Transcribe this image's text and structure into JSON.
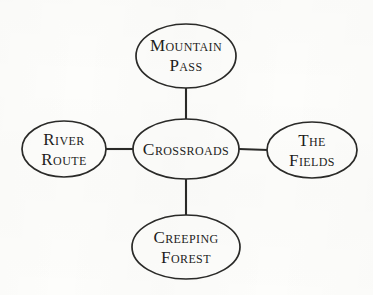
{
  "diagram": {
    "type": "hub-and-spoke-node-graph",
    "background_color": "#fdfdfb",
    "stroke_color": "#2a2a28",
    "text_color": "#1d1d1b",
    "center": {
      "id": "crossroads",
      "label": "Crossroads",
      "lines": [
        "Crossroads"
      ],
      "cx": 186,
      "cy": 149,
      "rx": 53,
      "ry": 30
    },
    "branches": [
      {
        "id": "mountain-pass",
        "label": "Mountain Pass",
        "lines": [
          "Mountain",
          "Pass"
        ],
        "direction": "top",
        "cx": 186,
        "cy": 56,
        "rx": 50,
        "ry": 32
      },
      {
        "id": "the-fields",
        "label": "The Fields",
        "lines": [
          "The",
          "Fields"
        ],
        "direction": "right",
        "cx": 312,
        "cy": 150,
        "rx": 45,
        "ry": 28
      },
      {
        "id": "creeping-forest",
        "label": "Creeping Forest",
        "lines": [
          "Creeping",
          "Forest"
        ],
        "direction": "bottom",
        "cx": 186,
        "cy": 247,
        "rx": 54,
        "ry": 32
      },
      {
        "id": "river-route",
        "label": "River Route",
        "lines": [
          "River",
          "Route"
        ],
        "direction": "left",
        "cx": 64,
        "cy": 149,
        "rx": 42,
        "ry": 28
      }
    ],
    "edges": [
      {
        "id": "edge-center-mountain-pass",
        "from": "crossroads",
        "to": "mountain-pass",
        "orientation": "vertical"
      },
      {
        "id": "edge-center-the-fields",
        "from": "crossroads",
        "to": "the-fields",
        "orientation": "horizontal"
      },
      {
        "id": "edge-center-creeping-forest",
        "from": "crossroads",
        "to": "creeping-forest",
        "orientation": "vertical"
      },
      {
        "id": "edge-center-river-route",
        "from": "crossroads",
        "to": "river-route",
        "orientation": "horizontal"
      }
    ]
  }
}
